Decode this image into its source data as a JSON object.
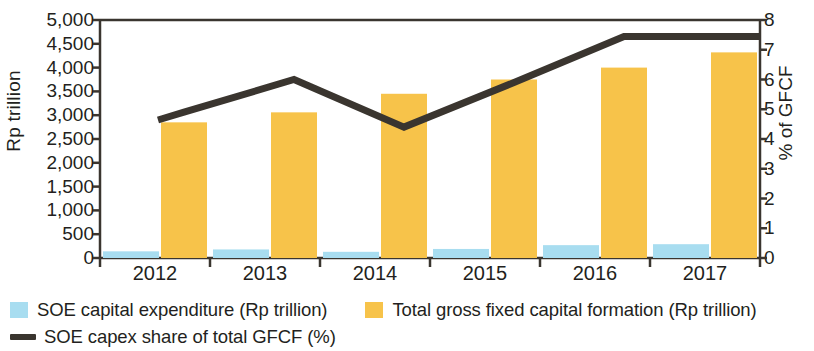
{
  "chart_data": {
    "type": "bar",
    "title": "",
    "subtitle": "",
    "categories": [
      "2012",
      "2013",
      "2014",
      "2015",
      "2016",
      "2017"
    ],
    "xlabel": "",
    "ylabel": "Rp trillion",
    "y2label": "% of GFCF",
    "ylim": [
      0,
      5000
    ],
    "y2lim": [
      0,
      8
    ],
    "yticks": [
      "0",
      "500",
      "1,000",
      "1,500",
      "2,000",
      "2,500",
      "3,000",
      "3,500",
      "4,000",
      "4,500",
      "5,000"
    ],
    "ytick_values": [
      0,
      500,
      1000,
      1500,
      2000,
      2500,
      3000,
      3500,
      4000,
      4500,
      5000
    ],
    "y2ticks": [
      "0",
      "1",
      "2",
      "3",
      "4",
      "5",
      "6",
      "7",
      "8"
    ],
    "y2tick_values": [
      0,
      1,
      2,
      3,
      4,
      5,
      6,
      7,
      8
    ],
    "grid": false,
    "legend_position": "bottom-left",
    "series": [
      {
        "name": "SOE capital expenditure (Rp trillion)",
        "type": "bar",
        "axis": "left",
        "color": "#A8DDF0",
        "values": [
          140,
          180,
          130,
          190,
          270,
          290
        ]
      },
      {
        "name": "Total gross fixed capital formation (Rp trillion)",
        "type": "bar",
        "axis": "left",
        "color": "#F7C34A",
        "values": [
          2850,
          3060,
          3450,
          3750,
          4000,
          4320
        ]
      },
      {
        "name": "SOE capex share of total GFCF (%)",
        "type": "line",
        "axis": "right",
        "color": "#3A352F",
        "values": [
          4.9,
          6.0,
          4.4,
          5.9,
          7.45,
          7.45
        ]
      }
    ]
  },
  "legend": {
    "items": [
      {
        "label": "SOE capital expenditure (Rp trillion)",
        "marker": "square-swatch",
        "color": "#A8DDF0"
      },
      {
        "label": "Total gross fixed capital formation (Rp trillion)",
        "marker": "square-swatch",
        "color": "#F7C34A"
      },
      {
        "label": "SOE capex share of total GFCF (%)",
        "marker": "line-swatch",
        "color": "#3A352F"
      }
    ]
  },
  "axes": {
    "left_title": "Rp trillion",
    "right_title": "% of GFCF"
  }
}
